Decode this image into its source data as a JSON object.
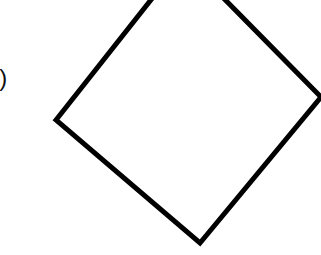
{
  "figure": {
    "label": "i)",
    "shape": "square rotated (diamond), outline only",
    "stroke_color": "#000000",
    "fill_color": "#ffffff"
  }
}
